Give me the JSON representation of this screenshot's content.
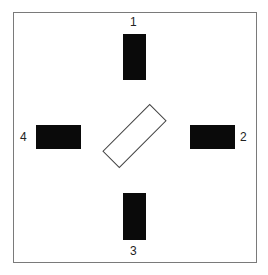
{
  "diagram": {
    "type": "layout-diagram",
    "colors": {
      "block": "#0a0a0a",
      "frame": "#7a7a7a",
      "outline": "#444444",
      "background": "#ffffff"
    },
    "blocks": [
      {
        "id": 1,
        "label": "1",
        "position": "top"
      },
      {
        "id": 2,
        "label": "2",
        "position": "right"
      },
      {
        "id": 3,
        "label": "3",
        "position": "bottom"
      },
      {
        "id": 4,
        "label": "4",
        "position": "left"
      }
    ],
    "center": {
      "shape": "rectangle-outline",
      "rotation_deg": -45
    }
  }
}
